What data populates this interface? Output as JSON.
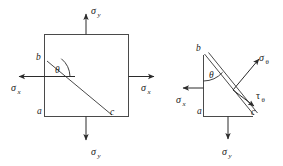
{
  "figure": {
    "background_color": "#ffffff",
    "line_color": "#4a4a4a",
    "arrow_color": "#2b2b2b",
    "text_color": "#1a1a1a"
  },
  "left_figure": {
    "name": "square-stress-element",
    "shape": "square",
    "vertices": {
      "b": "b",
      "a": "a",
      "c": "c"
    },
    "angle_label": "θ",
    "loads": [
      {
        "id": "sigma-y-top",
        "symbol": "σ",
        "subscript": "y",
        "direction": "up"
      },
      {
        "id": "sigma-y-bottom",
        "symbol": "σ",
        "subscript": "y",
        "direction": "down"
      },
      {
        "id": "sigma-x-left",
        "symbol": "σ",
        "subscript": "x",
        "direction": "left"
      },
      {
        "id": "sigma-x-right",
        "symbol": "σ",
        "subscript": "x",
        "direction": "right"
      }
    ]
  },
  "right_figure": {
    "name": "triangular-free-body",
    "shape": "right-triangle",
    "vertices": {
      "b": "b",
      "a": "a",
      "c": "c"
    },
    "angle_label": "θ",
    "loads": [
      {
        "id": "sigma-x-left",
        "symbol": "σ",
        "subscript": "x",
        "direction": "left"
      },
      {
        "id": "sigma-y-bottom",
        "symbol": "σ",
        "subscript": "y",
        "direction": "down"
      },
      {
        "id": "sigma-theta",
        "symbol": "σ",
        "subscript": "θ",
        "direction": "up-right-normal"
      },
      {
        "id": "tau-theta",
        "symbol": "τ",
        "subscript": "θ",
        "direction": "down-right-tangent"
      }
    ]
  },
  "labels": {
    "sigma": "σ",
    "tau": "τ",
    "theta": "θ",
    "sub_x": "x",
    "sub_y": "y",
    "sub_theta": "θ",
    "vertex_a": "a",
    "vertex_b": "b",
    "vertex_c": "c"
  }
}
